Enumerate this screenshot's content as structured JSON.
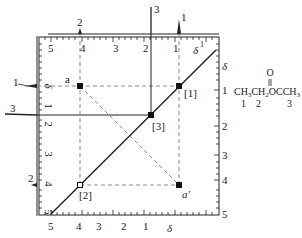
{
  "figure": {
    "type": "2D COSY NMR spectrum",
    "frame": {
      "left": 38,
      "right": 219,
      "top": 36,
      "bottom": 215
    },
    "colors": {
      "line": "#222222",
      "dashed": "#8a8a8a",
      "background": "#ffffff"
    }
  },
  "axes": {
    "top": {
      "label": "δ",
      "label_superscript": "1",
      "ticks": [
        {
          "text": "5",
          "x": 51
        },
        {
          "text": "4",
          "x": 82
        },
        {
          "text": "3",
          "x": 116
        },
        {
          "text": "2",
          "x": 145
        },
        {
          "text": "1",
          "x": 176
        }
      ]
    },
    "bottom": {
      "label": "δ",
      "ticks": [
        {
          "text": "5",
          "x": 51
        },
        {
          "text": "4",
          "x": 79
        },
        {
          "text": "3",
          "x": 99
        },
        {
          "text": "2",
          "x": 124
        },
        {
          "text": "1",
          "x": 145
        }
      ]
    },
    "left": {
      "label": "δ",
      "ticks": [
        {
          "text": "1",
          "y": 106
        },
        {
          "text": "2",
          "y": 124
        },
        {
          "text": "3",
          "y": 154
        },
        {
          "text": "4",
          "y": 184
        },
        {
          "text": "5",
          "y": 214
        }
      ]
    },
    "right": {
      "label": "δ",
      "ticks": [
        {
          "text": "1",
          "y": 91
        },
        {
          "text": "2",
          "y": 127
        },
        {
          "text": "3",
          "y": 156
        },
        {
          "text": "4",
          "y": 181
        },
        {
          "text": "5",
          "y": 215
        }
      ]
    }
  },
  "projections": {
    "top_peaks": [
      {
        "label": "2",
        "x": 80
      },
      {
        "label": "3",
        "x": 151
      },
      {
        "label": "1",
        "x": 179
      }
    ],
    "left_peaks": [
      {
        "label": "1",
        "y": 86
      },
      {
        "label": "3",
        "y": 115
      },
      {
        "label": "2",
        "y": 185
      }
    ]
  },
  "cross_peaks": [
    {
      "label": "a",
      "x": 80,
      "y": 86,
      "filled": true
    },
    {
      "label": "[1]",
      "x": 179,
      "y": 86,
      "filled": true
    },
    {
      "label": "[3]",
      "x": 151,
      "y": 115,
      "filled": true
    },
    {
      "label": "[2]",
      "x": 80,
      "y": 185,
      "filled": false
    },
    {
      "label": "a'",
      "x": 179,
      "y": 185,
      "filled": true
    }
  ],
  "molecule": {
    "formula_parts": [
      "CH",
      "3",
      "CH",
      "2",
      "OCCH",
      "3"
    ],
    "carbonyl_oxygen": "O",
    "position_labels": [
      "1",
      "2",
      "3"
    ]
  },
  "labels": {
    "top_peak_2": "2",
    "top_peak_3": "3",
    "top_peak_1": "1",
    "left_peak_1": "1",
    "left_peak_3": "3",
    "left_peak_2": "2",
    "a": "a",
    "a_prime": "a'",
    "p1": "[1]",
    "p2": "[2]",
    "p3": "[3]",
    "delta": "δ",
    "delta_sup": "1",
    "ax_top_5": "5",
    "ax_top_4": "4",
    "ax_top_3": "3",
    "ax_top_2": "2",
    "ax_top_1": "1",
    "ax_bot_5": "5",
    "ax_bot_4": "4",
    "ax_bot_3": "3",
    "ax_bot_2": "2",
    "ax_bot_1": "1",
    "ax_left_1": "1",
    "ax_left_2": "2",
    "ax_left_3": "3",
    "ax_left_4": "4",
    "ax_left_5": "5",
    "ax_right_1": "1",
    "ax_right_2": "2",
    "ax_right_3": "3",
    "ax_right_4": "4",
    "ax_right_5": "5",
    "chem_CH": "CH",
    "chem_3": "3",
    "chem_CH2": "CH",
    "chem_2": "2",
    "chem_OCCH": "OCCH",
    "chem_3b": "3",
    "chem_O": "O",
    "chem_n1": "1",
    "chem_n2": "2",
    "chem_n3": "3"
  }
}
